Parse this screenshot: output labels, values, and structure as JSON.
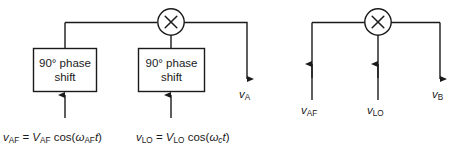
{
  "diagram": {
    "stroke_color": "#1a1a1a",
    "background_color": "#ffffff",
    "circuits": [
      {
        "id": "left-circuit",
        "mixer": {
          "symbol": "×",
          "name": "multiplier"
        },
        "blocks": [
          {
            "id": "phase-shift-af",
            "line1": "90° phase",
            "line2": "shift"
          },
          {
            "id": "phase-shift-lo",
            "line1": "90° phase",
            "line2": "shift"
          }
        ],
        "output": {
          "base": "v",
          "sub": "A"
        },
        "equations": [
          {
            "id": "eq-af",
            "lhs_base": "v",
            "lhs_sub": "AF",
            "eq": "=",
            "amp_base": "V",
            "amp_sub": "AF",
            "fn": "cos",
            "open": "(",
            "omega": "ω",
            "omega_sub": "AF",
            "time": "t",
            "close": ")",
            "plain": "v_AF = V_AF cos(ω_AF t)"
          },
          {
            "id": "eq-lo",
            "lhs_base": "v",
            "lhs_sub": "LO",
            "eq": "=",
            "amp_base": "V",
            "amp_sub": "LO",
            "fn": "cos",
            "open": "(",
            "omega": "ω",
            "omega_sub": "c",
            "time": "t",
            "close": ")",
            "plain": "v_LO = V_LO cos(ω_c t)"
          }
        ]
      },
      {
        "id": "right-circuit",
        "mixer": {
          "symbol": "×",
          "name": "multiplier"
        },
        "inputs": [
          {
            "id": "input-af",
            "base": "v",
            "sub": "AF"
          },
          {
            "id": "input-lo",
            "base": "v",
            "sub": "LO"
          }
        ],
        "output": {
          "base": "v",
          "sub": "B"
        }
      }
    ]
  }
}
